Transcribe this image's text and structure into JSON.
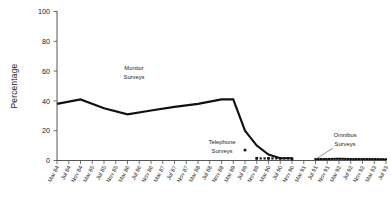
{
  "chart_data": {
    "type": "line",
    "title": "",
    "xlabel": "",
    "ylabel": "Percentage",
    "ylim": [
      0,
      100
    ],
    "yticks": [
      0,
      20,
      40,
      60,
      80,
      100
    ],
    "grid": false,
    "legend_position": "none",
    "categories": [
      "Mar 84",
      "Jul 84",
      "Nov 84",
      "Mar 85",
      "Jul 85",
      "Nov 85",
      "Mar 86",
      "Jul 86",
      "Nov 86",
      "Mar 87",
      "Jul 87",
      "Nov 87",
      "Mar 88",
      "Jul 88",
      "Nov 88",
      "Mar 89",
      "Jul 89",
      "Nov 89",
      "Mar 90",
      "Jul 90",
      "Nov 90",
      "Mar 91",
      "Jul 91",
      "Nov 91",
      "Mar 92",
      "Jul 92",
      "Nov 92",
      "Mar 93",
      "Jul 93"
    ],
    "series": [
      {
        "name": "Monitor Surveys",
        "style": "thick-line",
        "x": [
          "Mar 84",
          "Nov 84",
          "Jul 85",
          "Mar 86",
          "Nov 86",
          "Jul 87",
          "Mar 88",
          "Nov 88",
          "Mar 89",
          "Jul 89",
          "Nov 89",
          "Mar 90",
          "Jul 90",
          "Nov 90"
        ],
        "values": [
          38,
          41,
          35,
          31,
          33.5,
          36,
          38,
          41,
          41,
          20,
          10,
          4,
          1.5,
          1.5
        ]
      },
      {
        "name": "Telephone Surveys",
        "style": "markers",
        "x": [
          "Jul 89",
          "Nov 89",
          "Mar 90",
          "Jul 90",
          "Nov 90"
        ],
        "values": [
          7,
          1.5,
          1.5,
          1.5,
          1
        ]
      },
      {
        "name": "Omnibus Surveys",
        "style": "thin-line-markers",
        "x": [
          "Jul 91",
          "Nov 91",
          "Mar 92",
          "Jul 92",
          "Nov 92",
          "Mar 93",
          "Jul 93"
        ],
        "values": [
          1,
          1,
          1.2,
          1,
          1,
          1,
          0.8
        ]
      }
    ],
    "annotations": [
      {
        "id": "monitor",
        "line1": "Monitor",
        "line2": "Surveys"
      },
      {
        "id": "telephone",
        "line1": "Telephone",
        "line2": "Surveys"
      },
      {
        "id": "omnibus",
        "line1": "Omnibus",
        "line2": "Surveys"
      }
    ]
  },
  "axis": {
    "y_title": "Percentage",
    "y_labels": [
      "100",
      "80",
      "60",
      "40",
      "20",
      "0"
    ],
    "x_labels": [
      "Mar 84",
      "Jul 84",
      "Nov 84",
      "Mar 85",
      "Jul 85",
      "Nov 85",
      "Mar 86",
      "Jul 86",
      "Nov 86",
      "Mar 87",
      "Jul 87",
      "Nov 87",
      "Mar 88",
      "Jul 88",
      "Nov 88",
      "Mar 89",
      "Jul 89",
      "Nov 89",
      "Mar 90",
      "Jul 90",
      "Nov 90",
      "Mar 91",
      "Jul 91",
      "Nov 91",
      "Mar 92",
      "Jul 92",
      "Nov 92",
      "Mar 93",
      "Jul 93"
    ]
  },
  "annotations": {
    "monitor_line1": "Monitor",
    "monitor_line2": "Surveys",
    "telephone_line1": "Telephone",
    "telephone_line2": "Surveys",
    "omnibus_line1": "Omnibus",
    "omnibus_line2": "Surveys"
  },
  "colors": {
    "series": "#111111",
    "axis": "#3a3a3a",
    "background": "#ffffff",
    "text": "#1a1a1a"
  }
}
